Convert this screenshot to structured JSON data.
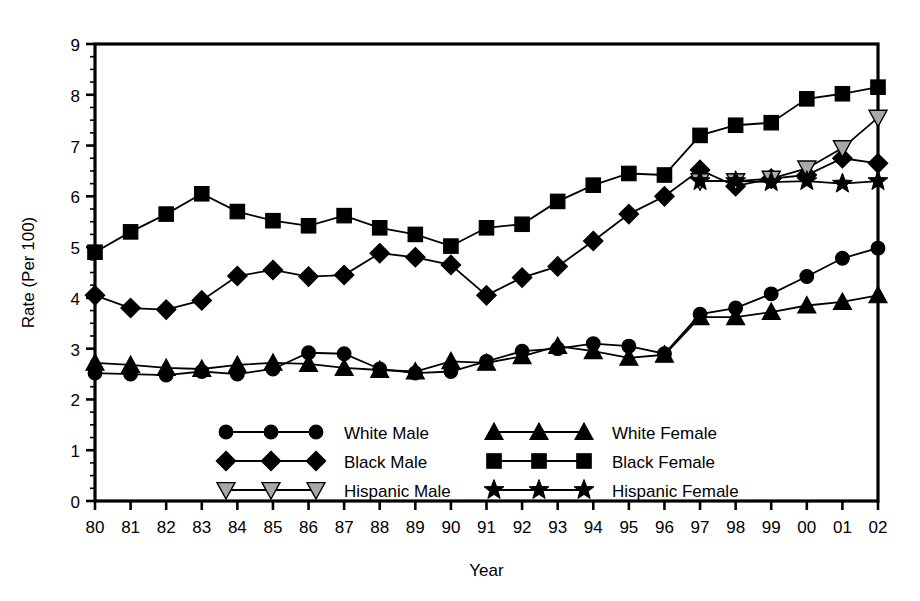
{
  "chart_data": {
    "type": "line",
    "title": "",
    "xlabel": "Year",
    "ylabel": "Rate (Per 100)",
    "xlim": [
      1980,
      2002
    ],
    "ylim": [
      0,
      9
    ],
    "yticks": [
      "0",
      "1",
      "2",
      "3",
      "4",
      "5",
      "6",
      "7",
      "8",
      "9"
    ],
    "ytick_values": [
      0,
      1,
      2,
      3,
      4,
      5,
      6,
      7,
      8,
      9
    ],
    "grid": false,
    "legend_position": "inside-lower-center",
    "categories": [
      "80",
      "81",
      "82",
      "83",
      "84",
      "85",
      "86",
      "87",
      "88",
      "89",
      "90",
      "91",
      "92",
      "93",
      "94",
      "95",
      "96",
      "97",
      "98",
      "99",
      "00",
      "01",
      "02"
    ],
    "x": [
      1980,
      1981,
      1982,
      1983,
      1984,
      1985,
      1986,
      1987,
      1988,
      1989,
      1990,
      1991,
      1992,
      1993,
      1994,
      1995,
      1996,
      1997,
      1998,
      1999,
      2000,
      2001,
      2002
    ],
    "series": [
      {
        "name": "White Male",
        "marker": "circle",
        "color": "#000000",
        "fill": "#000000",
        "values": [
          2.52,
          2.5,
          2.48,
          2.55,
          2.5,
          2.6,
          2.92,
          2.9,
          2.6,
          2.52,
          2.55,
          2.75,
          2.95,
          3.0,
          3.1,
          3.05,
          2.9,
          3.68,
          3.8,
          4.08,
          4.42,
          4.78,
          4.98
        ]
      },
      {
        "name": "Black Male",
        "marker": "diamond",
        "color": "#000000",
        "fill": "#000000",
        "values": [
          4.05,
          3.8,
          3.77,
          3.95,
          4.43,
          4.55,
          4.42,
          4.45,
          4.88,
          4.8,
          4.65,
          4.05,
          4.4,
          4.62,
          5.12,
          5.65,
          6.0,
          6.52,
          6.2,
          6.35,
          6.42,
          6.75,
          6.65
        ]
      },
      {
        "name": "Hispanic Male",
        "marker": "triangle-down",
        "color": "#000000",
        "fill": "#a8a8a8",
        "values": [
          null,
          null,
          null,
          null,
          null,
          null,
          null,
          null,
          null,
          null,
          null,
          null,
          null,
          null,
          null,
          null,
          null,
          6.3,
          6.3,
          6.35,
          6.55,
          6.95,
          7.55
        ]
      },
      {
        "name": "White Female",
        "marker": "triangle-up",
        "color": "#000000",
        "fill": "#000000",
        "values": [
          2.72,
          2.68,
          2.62,
          2.6,
          2.68,
          2.72,
          2.7,
          2.62,
          2.58,
          2.55,
          2.75,
          2.72,
          2.85,
          3.05,
          2.95,
          2.82,
          2.88,
          3.62,
          3.62,
          3.72,
          3.85,
          3.92,
          4.05
        ]
      },
      {
        "name": "Black Female",
        "marker": "square",
        "color": "#000000",
        "fill": "#000000",
        "values": [
          4.9,
          5.3,
          5.65,
          6.05,
          5.7,
          5.52,
          5.42,
          5.62,
          5.38,
          5.25,
          5.02,
          5.38,
          5.45,
          5.9,
          6.22,
          6.45,
          6.42,
          7.2,
          7.4,
          7.45,
          7.92,
          8.02,
          8.15
        ]
      },
      {
        "name": "Hispanic Female",
        "marker": "star",
        "color": "#000000",
        "fill": "#000000",
        "values": [
          null,
          null,
          null,
          null,
          null,
          null,
          null,
          null,
          null,
          null,
          null,
          null,
          null,
          null,
          null,
          null,
          null,
          6.3,
          6.3,
          6.28,
          6.3,
          6.25,
          6.3
        ]
      }
    ],
    "legend": [
      {
        "label": "White Male",
        "marker": "circle",
        "fill": "#000000"
      },
      {
        "label": "Black Male",
        "marker": "diamond",
        "fill": "#000000"
      },
      {
        "label": "Hispanic Male",
        "marker": "triangle-down",
        "fill": "#a8a8a8"
      },
      {
        "label": "White Female",
        "marker": "triangle-up",
        "fill": "#000000"
      },
      {
        "label": "Black Female",
        "marker": "square",
        "fill": "#000000"
      },
      {
        "label": "Hispanic Female",
        "marker": "star",
        "fill": "#000000"
      }
    ]
  }
}
